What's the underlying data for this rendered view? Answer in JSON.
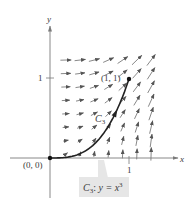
{
  "figure": {
    "axes": {
      "x_label": "x",
      "y_label": "y",
      "x_tick": "1",
      "y_tick": "1",
      "origin_px": [
        50,
        158
      ],
      "unit_px": 79
    },
    "points": [
      {
        "label": "(0, 0)",
        "x": 0,
        "y": 0
      },
      {
        "label": "(1, 1)",
        "x": 1,
        "y": 1
      }
    ],
    "curve": {
      "name": "C",
      "subscript": "3",
      "equation_lhs": "y = x",
      "equation_exp": "3",
      "callout": "C3: y = x^3"
    },
    "vector_field": {
      "expression": "F(x, y) = y i + x^2 j",
      "grid_x": [
        0.2,
        0.38,
        0.56,
        0.74,
        0.92,
        1.1,
        1.28
      ],
      "grid_y": [
        0.05,
        0.22,
        0.39,
        0.56,
        0.73,
        0.9,
        1.07,
        1.24
      ],
      "color": "#555555"
    },
    "colors": {
      "axis": "#7a7a7a",
      "curve": "#222222",
      "callout_bg": "#e6e6e6"
    }
  }
}
